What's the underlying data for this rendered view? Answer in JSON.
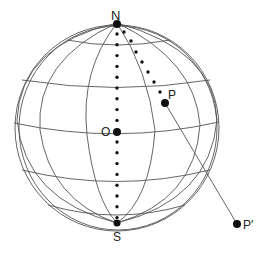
{
  "diagram": {
    "points": {
      "north": {
        "label": "N"
      },
      "south": {
        "label": "S"
      },
      "center": {
        "label": "O"
      },
      "p": {
        "label": "P"
      },
      "p_prime": {
        "label": "P′"
      }
    },
    "latitudes_deg": [
      60,
      30,
      0,
      -30,
      -60
    ],
    "meridians_count": 6,
    "colors": {
      "lines": "#555555",
      "points": "#111111",
      "background": "#ffffff"
    }
  }
}
